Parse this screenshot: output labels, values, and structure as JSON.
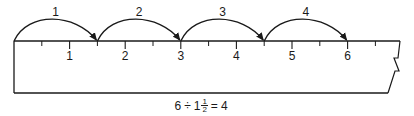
{
  "diagram": {
    "ruler": {
      "origin_x": 14,
      "unit_px": 55.6,
      "top_y": 41,
      "bottom_y": 93,
      "major_ticks": [
        {
          "value": 1,
          "label": "1"
        },
        {
          "value": 2,
          "label": "2"
        },
        {
          "value": 3,
          "label": "3"
        },
        {
          "value": 4,
          "label": "4"
        },
        {
          "value": 5,
          "label": "5"
        },
        {
          "value": 6,
          "label": "6"
        }
      ],
      "minor_ticks": [
        0.5,
        1.5,
        2.5,
        3.5,
        4.5,
        5.5,
        6.5
      ],
      "edge_style": "torn-zigzag-right"
    },
    "jumps": [
      {
        "label": "1",
        "from": 0,
        "to": 1.5
      },
      {
        "label": "2",
        "from": 1.5,
        "to": 3
      },
      {
        "label": "3",
        "from": 3,
        "to": 4.5
      },
      {
        "label": "4",
        "from": 4.5,
        "to": 6
      }
    ],
    "equation": {
      "dividend": "6",
      "operator": "÷",
      "divisor_whole": "1",
      "divisor_num": "1",
      "divisor_den": "2",
      "equals": "=",
      "result": "4"
    },
    "colors": {
      "ink": "#1a1a1a",
      "background": "#ffffff"
    }
  }
}
